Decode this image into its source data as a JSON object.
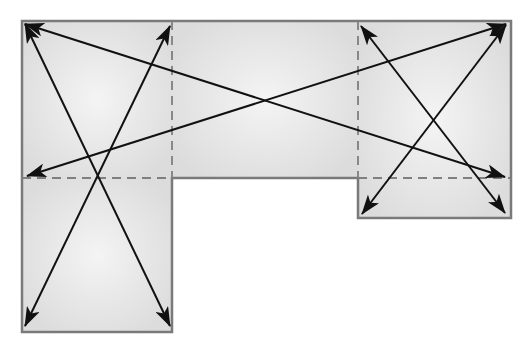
{
  "diagram": {
    "type": "floor-plan-diagonals",
    "colors": {
      "fill_edge": "#dedede",
      "fill_center": "#f3f3f3",
      "border": "#7a7a7a",
      "dash": "#7f7f7f",
      "arrow": "#111111",
      "background": "#ffffff"
    },
    "outline": {
      "points": [
        [
          22,
          21
        ],
        [
          511,
          21
        ],
        [
          511,
          218
        ],
        [
          358,
          218
        ],
        [
          358,
          178
        ],
        [
          172,
          178
        ],
        [
          172,
          332
        ],
        [
          22,
          332
        ]
      ]
    },
    "sections": [
      {
        "name": "left-top",
        "x": 22,
        "y": 21,
        "w": 150,
        "h": 157
      },
      {
        "name": "middle",
        "x": 172,
        "y": 21,
        "w": 186,
        "h": 157
      },
      {
        "name": "right",
        "x": 358,
        "y": 21,
        "w": 153,
        "h": 197
      },
      {
        "name": "left-bottom",
        "x": 22,
        "y": 178,
        "w": 150,
        "h": 154
      }
    ],
    "dashed_lines": [
      {
        "name": "vertical-left-divider",
        "x1": 172,
        "y1": 21,
        "x2": 172,
        "y2": 178
      },
      {
        "name": "vertical-right-divider",
        "x1": 358,
        "y1": 21,
        "x2": 358,
        "y2": 178
      },
      {
        "name": "horizontal-left-divider",
        "x1": 22,
        "y1": 178,
        "x2": 172,
        "y2": 178
      },
      {
        "name": "horizontal-right-divider",
        "x1": 358,
        "y1": 178,
        "x2": 511,
        "y2": 178
      }
    ],
    "arrows": [
      {
        "name": "diagonal-topleft-to-right-mid",
        "x1": 25,
        "y1": 24,
        "x2": 505,
        "y2": 177
      },
      {
        "name": "diagonal-left-mid-to-topright",
        "x1": 27,
        "y1": 176,
        "x2": 506,
        "y2": 24
      },
      {
        "name": "diagonal-topleft-to-bottom-right-of-left",
        "x1": 25,
        "y1": 24,
        "x2": 170,
        "y2": 326
      },
      {
        "name": "diagonal-top-of-divider-to-bottom-left",
        "x1": 170,
        "y1": 26,
        "x2": 25,
        "y2": 326
      },
      {
        "name": "diagonal-right-block-topleft-to-bottomright",
        "x1": 361,
        "y1": 26,
        "x2": 505,
        "y2": 213
      },
      {
        "name": "diagonal-right-block-topright-to-bottomleft",
        "x1": 506,
        "y1": 25,
        "x2": 362,
        "y2": 214
      }
    ]
  }
}
